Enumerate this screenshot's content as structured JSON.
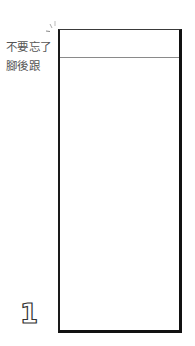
{
  "caption": {
    "line1": "不要忘了",
    "line2": "腳後跟"
  },
  "page_number": "1",
  "colors": {
    "frame": "#111111",
    "divider": "#8a8a8a",
    "text": "#555555"
  }
}
